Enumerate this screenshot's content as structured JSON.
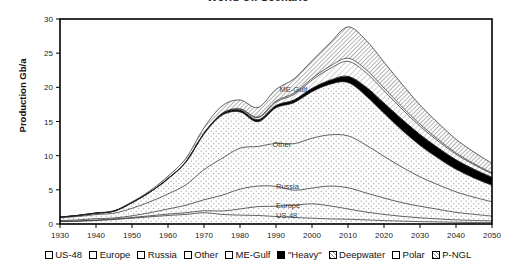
{
  "chart_data": {
    "type": "area",
    "title": "World Oil Scenario",
    "xlabel": "",
    "ylabel": "Production Gb/a",
    "xlim": [
      1930,
      2050
    ],
    "ylim": [
      0,
      30
    ],
    "xticks": [
      1930,
      1940,
      1950,
      1960,
      1970,
      1980,
      1990,
      2000,
      2010,
      2020,
      2030,
      2040,
      2050
    ],
    "yticks": [
      0,
      5,
      10,
      15,
      20,
      25,
      30
    ],
    "grid": false,
    "stacked": true,
    "legend_position": "bottom",
    "x": [
      1930,
      1935,
      1940,
      1945,
      1950,
      1955,
      1960,
      1965,
      1970,
      1975,
      1980,
      1985,
      1990,
      1995,
      2000,
      2005,
      2010,
      2015,
      2020,
      2025,
      2030,
      2035,
      2040,
      2045,
      2050
    ],
    "series": [
      {
        "name": "US-48",
        "label_in_chart": "US-48",
        "values": [
          0.35,
          0.4,
          0.5,
          0.65,
          0.85,
          1.05,
          1.25,
          1.4,
          1.65,
          1.4,
          1.3,
          1.25,
          1.1,
          0.95,
          0.85,
          0.75,
          0.7,
          0.6,
          0.5,
          0.42,
          0.35,
          0.3,
          0.25,
          0.22,
          0.2
        ]
      },
      {
        "name": "Europe",
        "label_in_chart": "Europe",
        "values": [
          0.05,
          0.05,
          0.08,
          0.08,
          0.1,
          0.15,
          0.2,
          0.25,
          0.3,
          0.5,
          0.9,
          1.3,
          1.5,
          1.8,
          2.1,
          1.9,
          1.5,
          1.15,
          0.9,
          0.7,
          0.55,
          0.45,
          0.35,
          0.3,
          0.25
        ]
      },
      {
        "name": "Russia",
        "label_in_chart": "Russia",
        "values": [
          0.1,
          0.15,
          0.2,
          0.15,
          0.25,
          0.45,
          0.75,
          1.1,
          1.6,
          2.3,
          2.9,
          3.0,
          2.9,
          2.2,
          2.3,
          2.9,
          3.1,
          2.8,
          2.4,
          2.0,
          1.7,
          1.4,
          1.1,
          0.9,
          0.7
        ]
      },
      {
        "name": "Other",
        "label_in_chart": "Other",
        "values": [
          0.4,
          0.5,
          0.6,
          0.7,
          1.1,
          1.6,
          2.2,
          3.0,
          4.4,
          5.4,
          6.0,
          5.8,
          6.3,
          6.8,
          7.3,
          7.5,
          7.6,
          7.0,
          6.1,
          5.2,
          4.3,
          3.6,
          3.0,
          2.5,
          2.1
        ]
      },
      {
        "name": "ME-Gulf",
        "label_in_chart": "ME-Gulf",
        "values": [
          0.1,
          0.15,
          0.2,
          0.3,
          0.8,
          1.4,
          2.2,
          3.3,
          5.2,
          6.3,
          5.3,
          3.6,
          5.2,
          6.0,
          6.8,
          7.4,
          7.8,
          7.2,
          6.3,
          5.4,
          4.6,
          3.9,
          3.3,
          2.8,
          2.4
        ]
      },
      {
        "name": "\"Heavy\"",
        "label_in_chart": "",
        "values": [
          0.0,
          0.0,
          0.0,
          0.0,
          0.02,
          0.03,
          0.05,
          0.08,
          0.12,
          0.2,
          0.25,
          0.3,
          0.35,
          0.4,
          0.5,
          0.6,
          0.9,
          1.3,
          1.5,
          1.6,
          1.6,
          1.5,
          1.4,
          1.3,
          1.2
        ]
      },
      {
        "name": "Deepwater",
        "label_in_chart": "",
        "values": [
          0.0,
          0.0,
          0.0,
          0.0,
          0.0,
          0.0,
          0.0,
          0.0,
          0.02,
          0.05,
          0.15,
          0.3,
          0.5,
          0.8,
          1.2,
          1.7,
          2.2,
          2.1,
          1.8,
          1.5,
          1.2,
          1.0,
          0.8,
          0.65,
          0.5
        ]
      },
      {
        "name": "Polar",
        "label_in_chart": "",
        "values": [
          0.0,
          0.0,
          0.0,
          0.0,
          0.0,
          0.0,
          0.0,
          0.0,
          0.0,
          0.02,
          0.05,
          0.1,
          0.15,
          0.2,
          0.25,
          0.35,
          0.45,
          0.45,
          0.4,
          0.35,
          0.3,
          0.25,
          0.2,
          0.15,
          0.12
        ]
      },
      {
        "name": "P-NGL",
        "label_in_chart": "",
        "values": [
          0.02,
          0.03,
          0.05,
          0.07,
          0.12,
          0.2,
          0.35,
          0.5,
          0.8,
          1.1,
          1.3,
          1.4,
          1.7,
          2.1,
          2.6,
          3.4,
          4.6,
          4.3,
          3.8,
          3.3,
          2.8,
          2.4,
          2.0,
          1.7,
          1.4
        ]
      }
    ]
  },
  "axes": {
    "y_title": "Production Gb/a",
    "y_tick_labels": [
      "0",
      "5",
      "10",
      "15",
      "20",
      "25",
      "30"
    ],
    "x_tick_labels": [
      "1930",
      "1940",
      "1950",
      "1960",
      "1970",
      "1980",
      "1990",
      "2000",
      "2010",
      "2020",
      "2030",
      "2040",
      "2050"
    ]
  },
  "inline_labels": [
    {
      "text": "ME-Gulf",
      "x": 1991,
      "y": 19.3
    },
    {
      "text": "Other",
      "x": 1989,
      "y": 11.2
    },
    {
      "text": "Russia",
      "x": 1990,
      "y": 5.1
    },
    {
      "text": "Europe",
      "x": 1990,
      "y": 2.4
    },
    {
      "text": "US-48",
      "x": 1990,
      "y": 0.85
    }
  ],
  "legend": {
    "items": [
      {
        "label": "US-48",
        "pattern": "open"
      },
      {
        "label": "Europe",
        "pattern": "open"
      },
      {
        "label": "Russia",
        "pattern": "open"
      },
      {
        "label": "Other",
        "pattern": "open"
      },
      {
        "label": "ME-Gulf",
        "pattern": "open"
      },
      {
        "label": "\"Heavy\"",
        "pattern": "solid-black"
      },
      {
        "label": "Deepwater",
        "pattern": "hatch-dense"
      },
      {
        "label": "Polar",
        "pattern": "open"
      },
      {
        "label": "P-NGL",
        "pattern": "hatch-dense"
      }
    ]
  },
  "colors": {
    "axis": "#000000",
    "text": "#1a1a1a",
    "heavy_band": "#000000",
    "plot_background": "#ffffff",
    "region_fill": "#fdfdfd",
    "hatch_fill": "#d8d8d8"
  }
}
